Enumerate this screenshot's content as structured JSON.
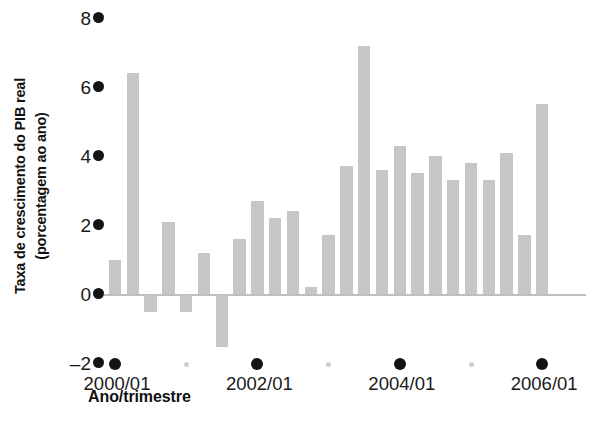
{
  "chart_data": {
    "type": "bar",
    "title": "",
    "subtitle": "",
    "xlabel": "Ano/trimestre",
    "ylabel": "Taxa de crescimento do PIB real (porcentagem ao ano)",
    "ylabel_line1": "Taxa de crescimento do PIB real",
    "ylabel_line2": "(porcentagem ao ano)",
    "ylim": [
      -2,
      8
    ],
    "yticks": [
      8,
      6,
      4,
      2,
      0,
      -2
    ],
    "ytick_labels": [
      "8",
      "6",
      "4",
      "2",
      "0",
      "–2"
    ],
    "grid": false,
    "legend": "none",
    "bar_color": "#c6c6c6",
    "axis_text_color": "#1a1a1a",
    "tick_marker_color": "#141414",
    "minor_tick_marker_color": "#cfcfcf",
    "zero_line_color": "#bfbfbf",
    "xtick_labels": [
      "2000/01",
      "2002/01",
      "2004/01",
      "2006/01"
    ],
    "xtick_label_indices": [
      0,
      8,
      16,
      24
    ],
    "minor_tick_indices": [
      4,
      12,
      20
    ],
    "categories": [
      "2000/01",
      "2000/02",
      "2000/03",
      "2000/04",
      "2001/01",
      "2001/02",
      "2001/03",
      "2001/04",
      "2002/01",
      "2002/02",
      "2002/03",
      "2002/04",
      "2003/01",
      "2003/02",
      "2003/03",
      "2003/04",
      "2004/01",
      "2004/02",
      "2004/03",
      "2004/04",
      "2005/01",
      "2005/02",
      "2005/03",
      "2005/04",
      "2006/01",
      "2006/02"
    ],
    "values": [
      1.0,
      6.4,
      -0.5,
      2.1,
      -0.5,
      1.2,
      -1.5,
      1.6,
      2.7,
      2.2,
      2.4,
      0.2,
      1.7,
      3.7,
      7.2,
      3.6,
      4.3,
      3.5,
      4.0,
      3.3,
      3.8,
      3.3,
      4.1,
      1.7,
      5.5,
      0
    ]
  }
}
